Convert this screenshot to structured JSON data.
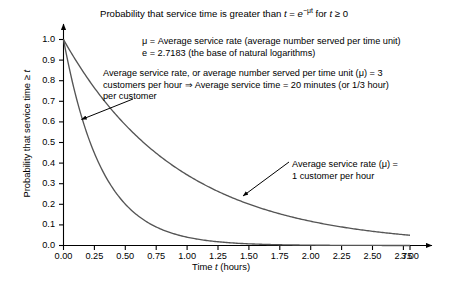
{
  "chart_data": {
    "type": "line",
    "title": "Probability that service time is greater than t = e−μt for t ≥ 0",
    "title_parts": {
      "lead": "Probability that service time is greater than ",
      "var_t": "t",
      "equals": " = ",
      "base": "e",
      "exponent": "−μt",
      "tail_lead": " for ",
      "tail_var": "t",
      "tail_rest": " ≥ 0"
    },
    "xlabel": "Time t (hours)",
    "xlabel_parts": {
      "lead": "Time ",
      "var": "t",
      "tail": " (hours)"
    },
    "ylabel": "Probability that service time ≥ t",
    "ylabel_parts": {
      "lead": "Probability that service time ≥ ",
      "var": "t"
    },
    "xlim": [
      0,
      3
    ],
    "ylim": [
      0,
      1
    ],
    "grid": false,
    "legend": "none",
    "xticks": [
      "0.00",
      "0.25",
      "0.50",
      "0.75",
      "1.00",
      "1.25",
      "1.50",
      "1.75",
      "2.00",
      "2.25",
      "2.50",
      "2.75",
      "3.00"
    ],
    "xtick_values": [
      0,
      0.25,
      0.5,
      0.75,
      1.0,
      1.25,
      1.5,
      1.75,
      2.0,
      2.25,
      2.5,
      2.75,
      3.0
    ],
    "yticks": [
      "0.0",
      "0.1",
      "0.2",
      "0.3",
      "0.4",
      "0.5",
      "0.6",
      "0.7",
      "0.8",
      "0.9",
      "1.0"
    ],
    "ytick_values": [
      0.0,
      0.1,
      0.2,
      0.3,
      0.4,
      0.5,
      0.6,
      0.7,
      0.8,
      0.9,
      1.0
    ],
    "series": [
      {
        "name": "mu = 3 customers per hour",
        "mu": 3,
        "x": [
          0,
          0.125,
          0.25,
          0.375,
          0.5,
          0.625,
          0.75,
          0.875,
          1.0,
          1.25,
          1.5,
          1.75,
          2.0,
          2.25,
          2.5,
          2.75,
          3.0
        ],
        "values": [
          1.0,
          0.687,
          0.472,
          0.325,
          0.223,
          0.153,
          0.105,
          0.072,
          0.05,
          0.0235,
          0.0111,
          0.0052,
          0.0025,
          0.0012,
          0.00055,
          0.00026,
          0.00012
        ]
      },
      {
        "name": "mu = 1 customer per hour",
        "mu": 1,
        "x": [
          0,
          0.25,
          0.5,
          0.75,
          1.0,
          1.25,
          1.5,
          1.75,
          2.0,
          2.25,
          2.5,
          2.75,
          3.0
        ],
        "values": [
          1.0,
          0.779,
          0.607,
          0.472,
          0.368,
          0.287,
          0.223,
          0.174,
          0.135,
          0.105,
          0.082,
          0.064,
          0.05
        ]
      }
    ],
    "annotations": [
      {
        "id": "definitions",
        "lines": [
          "μ = Average service rate (average number served per time unit)",
          "e = 2.7183 (the base of natural logarithms)"
        ]
      },
      {
        "id": "example",
        "lines": [
          "Average service rate, or average number served per time unit (μ) = 3",
          "customers per hour ⇒ Average service time = 20 minutes (or 1/3 hour)",
          "per customer"
        ]
      },
      {
        "id": "mu-1-callout",
        "lines": [
          "Average service rate (μ) =",
          "1 customer per hour"
        ]
      }
    ],
    "colors": {
      "axis": "#000000",
      "curve": "#4d4d4d",
      "text": "#000000",
      "background": "#ffffff"
    }
  }
}
